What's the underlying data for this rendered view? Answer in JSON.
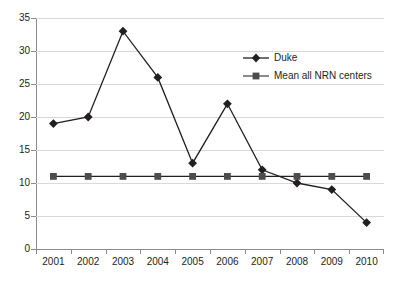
{
  "chart_data": {
    "type": "line",
    "title": "",
    "subtitle": "",
    "xlabel": "",
    "ylabel": "",
    "categories": [
      "2001",
      "2002",
      "2003",
      "2004",
      "2005",
      "2006",
      "2007",
      "2008",
      "2009",
      "2010"
    ],
    "series": [
      {
        "name": "Duke",
        "marker": "diamond",
        "color": "#231f20",
        "values": [
          19,
          20,
          33,
          26,
          13,
          22,
          12,
          10,
          9,
          4
        ]
      },
      {
        "name": "Mean all NRN centers",
        "marker": "square",
        "color": "#4d4d4d",
        "values": [
          11,
          11,
          11,
          11,
          11,
          11,
          11,
          11,
          11,
          11
        ]
      }
    ],
    "ylim": [
      0,
      35
    ],
    "yticks": [
      0,
      5,
      10,
      15,
      20,
      25,
      30,
      35
    ],
    "ytick_labels": [
      "0",
      "5",
      "10",
      "15",
      "20",
      "25",
      "30",
      "35"
    ],
    "grid": true,
    "grid_axis": "y",
    "legend_position": "upper-right",
    "legend": [
      "Duke",
      "Mean all NRN centers"
    ]
  },
  "colors": {
    "background": "#ffffff",
    "gridline": "#d9d9d9",
    "axis": "#8c8c8c",
    "text": "#231f20",
    "series_duke": "#231f20",
    "series_nrn": "#4d4d4d"
  }
}
